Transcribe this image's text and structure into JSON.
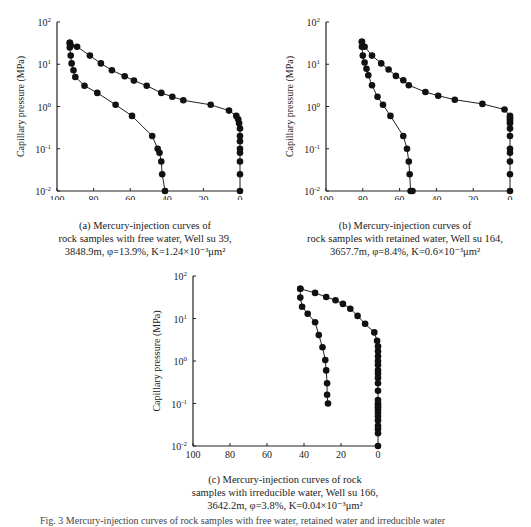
{
  "chart_data": [
    {
      "type": "line",
      "panel": "a",
      "title": "(a) Mercury-injection curves of rock samples with free water, Well su 39, 3848.9m, φ=13.9%, K=1.24×10⁻³μm²",
      "xlabel": "Mercury saturation (%)",
      "ylabel": "Capillary pressure (MPa)",
      "xlim": [
        100,
        0
      ],
      "ylim": [
        0.01,
        100
      ],
      "yscale": "log",
      "xticks": [
        "100",
        "80",
        "60",
        "40",
        "20",
        "0"
      ],
      "yticks": [
        "10²",
        "10¹",
        "10⁰",
        "10⁻¹",
        "10⁻²"
      ],
      "series": [
        {
          "name": "injection",
          "x": [
            0,
            0,
            0,
            0,
            0,
            0,
            0,
            0,
            0.5,
            1,
            2,
            6,
            16,
            31,
            37,
            43,
            51,
            58,
            63,
            70,
            76,
            82,
            89,
            92.5,
            93
          ],
          "y": [
            0.01,
            0.025,
            0.05,
            0.08,
            0.1,
            0.15,
            0.2,
            0.3,
            0.4,
            0.5,
            0.6,
            0.8,
            1.1,
            1.4,
            1.7,
            2.1,
            3.1,
            4.1,
            5.2,
            7.2,
            10.5,
            16,
            26,
            28,
            32
          ]
        },
        {
          "name": "withdrawal",
          "x": [
            93,
            93,
            92.5,
            92,
            91,
            90,
            85,
            78,
            68,
            59,
            48,
            45,
            44,
            43,
            42.5,
            41
          ],
          "y": [
            32,
            25,
            16,
            10.5,
            7.2,
            5,
            3.1,
            2.1,
            1.1,
            0.6,
            0.2,
            0.1,
            0.08,
            0.05,
            0.025,
            0.01
          ]
        }
      ]
    },
    {
      "type": "line",
      "panel": "b",
      "title": "(b) Mercury-injection curves of rock samples with retained water, Well su 164, 3657.7m, φ=8.4%, K=0.6×10⁻³μm²",
      "xlabel": "Mercury saturation (%)",
      "ylabel": "Capillary pressure (MPa)",
      "xlim": [
        100,
        0
      ],
      "ylim": [
        0.01,
        100
      ],
      "yscale": "log",
      "xticks": [
        "100",
        "80",
        "60",
        "40",
        "20",
        "0"
      ],
      "yticks": [
        "10²",
        "10¹",
        "10⁰",
        "10⁻¹",
        "10⁻²"
      ],
      "series": [
        {
          "name": "injection",
          "x": [
            0,
            0,
            0,
            0,
            0,
            0,
            0,
            0,
            0,
            0,
            0,
            0,
            3,
            15,
            30,
            39,
            46,
            55,
            58,
            62,
            66,
            70,
            75,
            79,
            80.5
          ],
          "y": [
            0.01,
            0.025,
            0.05,
            0.08,
            0.1,
            0.2,
            0.3,
            0.4,
            0.45,
            0.5,
            0.55,
            0.6,
            0.85,
            1.15,
            1.45,
            1.8,
            2.2,
            3.2,
            4.2,
            5.3,
            7.5,
            10.5,
            16,
            26,
            34
          ]
        },
        {
          "name": "withdrawal",
          "x": [
            80.5,
            80.5,
            80,
            79,
            78,
            77,
            75,
            72,
            69,
            65,
            58,
            56,
            55,
            54.5,
            54,
            53
          ],
          "y": [
            34,
            26,
            16,
            11,
            7.8,
            5.5,
            3.2,
            1.7,
            1.1,
            0.6,
            0.2,
            0.1,
            0.05,
            0.025,
            0.01,
            0.01
          ]
        }
      ]
    },
    {
      "type": "line",
      "panel": "c",
      "title": "(c) Mercury-injection curves of rock samples with irreducible water, Well su 166, 3642.2m, φ=3.8%, K=0.04×10⁻³μm²",
      "xlabel": "Mercury saturation (%)",
      "ylabel": "Capillary pressure (MPa)",
      "xlim": [
        100,
        0
      ],
      "ylim": [
        0.01,
        100
      ],
      "yscale": "log",
      "xticks": [
        "100",
        "80",
        "60",
        "40",
        "20",
        "0"
      ],
      "yticks": [
        "10²",
        "10¹",
        "10⁰",
        "10⁻¹",
        "10⁻²"
      ],
      "series": [
        {
          "name": "injection",
          "x": [
            0,
            0,
            0,
            0,
            0,
            0,
            0,
            0,
            0,
            0,
            0,
            0,
            0,
            0,
            0,
            0,
            0,
            0,
            0,
            0,
            0,
            0,
            0.5,
            2,
            7,
            11,
            15,
            19,
            23,
            28,
            34,
            42
          ],
          "y": [
            0.01,
            0.02,
            0.025,
            0.03,
            0.04,
            0.05,
            0.06,
            0.07,
            0.08,
            0.09,
            0.1,
            0.12,
            0.2,
            0.3,
            0.4,
            0.5,
            0.6,
            0.8,
            1,
            1.3,
            1.7,
            2.2,
            3,
            4.7,
            7.5,
            11.5,
            17,
            22,
            27,
            32,
            40,
            50
          ]
        },
        {
          "name": "withdrawal",
          "x": [
            42,
            42,
            41,
            38,
            34,
            32,
            30,
            28.5,
            28,
            27.5,
            27.5,
            27
          ],
          "y": [
            50,
            31,
            19,
            13,
            8.2,
            4.1,
            2.1,
            1.05,
            0.6,
            0.3,
            0.16,
            0.1
          ]
        }
      ]
    }
  ],
  "panels": {
    "a": {
      "ylabel": "Capillary pressure (MPa)",
      "xlabel": "Mercury saturation (%)",
      "caption": [
        "(a) Mercury-injection curves of",
        "rock samples with free water, Well su 39,",
        "3848.9m, φ=13.9%, K=1.24×10⁻³μm²"
      ]
    },
    "b": {
      "ylabel": "Capillary pressure (MPa)",
      "xlabel": "Mercury saturation (%)",
      "caption": [
        "(b) Mercury-injection curves of",
        "rock samples with retained water, Well su 164,",
        "3657.7m, φ=8.4%, K=0.6×10⁻³μm²"
      ]
    },
    "c": {
      "ylabel": "Capillary pressure (MPa)",
      "xlabel": "Mercury saturation (%)",
      "caption": [
        "(c) Mercury-injection curves of rock",
        "samples with irreducible water, Well su 166,",
        "3642.2m, φ=3.8%, K=0.04×10⁻³μm²"
      ]
    }
  },
  "figure_caption": "Fig. 3   Mercury-injection curves of rock samples with free water, retained water and irreducible water"
}
